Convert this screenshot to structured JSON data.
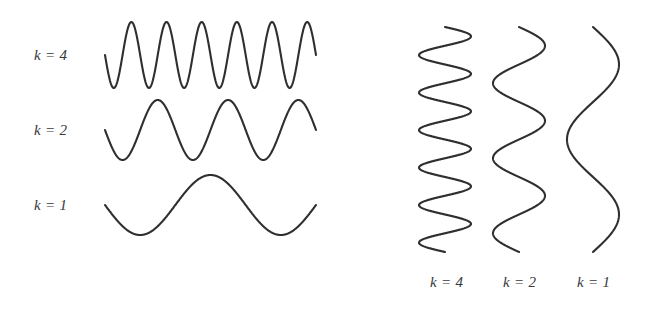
{
  "figure": {
    "background_color": "#ffffff",
    "stroke_color": "#2f2f31",
    "label_color": "#38383a",
    "width": 657,
    "height": 326
  },
  "left_panel": {
    "name": "horizontal-standing-waves",
    "labels": [
      {
        "id": "k4",
        "text": "k = 4"
      },
      {
        "id": "k2",
        "text": "k = 2"
      },
      {
        "id": "k1",
        "text": "k = 1"
      }
    ]
  },
  "right_panel": {
    "name": "vertical-standing-waves",
    "labels": [
      {
        "id": "k4",
        "text": "k = 4"
      },
      {
        "id": "k2",
        "text": "k = 2"
      },
      {
        "id": "k1",
        "text": "k = 1"
      }
    ]
  },
  "chart_data": {
    "type": "line",
    "title": "",
    "xlabel": "",
    "ylabel": "",
    "grid": false,
    "legend": "none",
    "series": [
      {
        "name": "k = 4 (horizontal)",
        "orientation": "horizontal",
        "k": 4,
        "cycles": 6,
        "amplitude": 33,
        "axis_center": 55,
        "x_start": 105,
        "x_end": 316,
        "phase_deg": 90
      },
      {
        "name": "k = 2 (horizontal)",
        "orientation": "horizontal",
        "k": 2,
        "cycles": 3,
        "amplitude": 30,
        "axis_center": 130,
        "x_start": 105,
        "x_end": 316,
        "phase_deg": 90
      },
      {
        "name": "k = 1 (horizontal)",
        "orientation": "horizontal",
        "k": 1,
        "cycles": 1.5,
        "amplitude": 30,
        "axis_center": 205,
        "x_start": 105,
        "x_end": 316,
        "phase_deg": 90
      },
      {
        "name": "k = 4 (vertical)",
        "orientation": "vertical",
        "k": 4,
        "cycles": 6,
        "amplitude": 26,
        "axis_center": 445,
        "y_start": 27,
        "y_end": 252,
        "phase_deg": 90
      },
      {
        "name": "k = 2 (vertical)",
        "orientation": "vertical",
        "k": 2,
        "cycles": 3,
        "amplitude": 26,
        "axis_center": 519,
        "y_start": 27,
        "y_end": 252,
        "phase_deg": 90
      },
      {
        "name": "k = 1 (vertical)",
        "orientation": "vertical",
        "k": 1,
        "cycles": 1.5,
        "amplitude": 26,
        "axis_center": 593,
        "y_start": 27,
        "y_end": 252,
        "phase_deg": 90
      }
    ],
    "x": [],
    "values": []
  }
}
